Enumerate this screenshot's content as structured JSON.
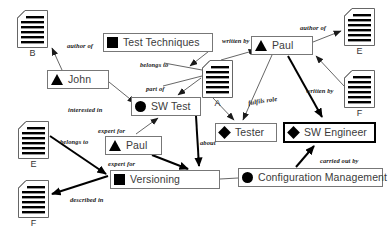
{
  "diagram": {
    "background_color": "#ffffff",
    "line_color": "#555555",
    "bold_line_color": "#000000",
    "nodes": [
      {
        "id": "test-techniques",
        "label": "Test Techniques",
        "glyph": "square",
        "x": 103,
        "y": 33,
        "w": 110,
        "highlight": false
      },
      {
        "id": "john",
        "label": "John",
        "glyph": "triangle",
        "x": 47,
        "y": 70,
        "w": 62,
        "highlight": false
      },
      {
        "id": "sw-test",
        "label": "SW Test",
        "glyph": "circle",
        "x": 131,
        "y": 97,
        "w": 70,
        "highlight": false
      },
      {
        "id": "paul-left",
        "label": "Paul",
        "glyph": "triangle",
        "x": 105,
        "y": 136,
        "w": 57,
        "highlight": false
      },
      {
        "id": "versioning",
        "label": "Versioning",
        "glyph": "square",
        "x": 110,
        "y": 170,
        "w": 110,
        "highlight": false
      },
      {
        "id": "paul-right",
        "label": "Paul",
        "glyph": "triangle",
        "x": 251,
        "y": 36,
        "w": 62,
        "highlight": false
      },
      {
        "id": "tester",
        "label": "Tester",
        "glyph": "diamond",
        "x": 215,
        "y": 123,
        "w": 62,
        "highlight": false
      },
      {
        "id": "sw-engineer",
        "label": "SW Engineer",
        "glyph": "diamond",
        "x": 283,
        "y": 122,
        "w": 93,
        "highlight": true
      },
      {
        "id": "config-mgmt",
        "label": "Configuration Management",
        "glyph": "circle",
        "x": 238,
        "y": 168,
        "w": 145,
        "highlight": false
      }
    ],
    "documents": [
      {
        "id": "doc-b",
        "label": "B",
        "x": 17,
        "y": 10
      },
      {
        "id": "doc-a",
        "label": "A",
        "x": 202,
        "y": 60
      },
      {
        "id": "doc-e-right",
        "label": "E",
        "x": 344,
        "y": 8
      },
      {
        "id": "doc-f-right",
        "label": "F",
        "x": 344,
        "y": 70
      },
      {
        "id": "doc-e-left",
        "label": "E",
        "x": 18,
        "y": 121
      },
      {
        "id": "doc-f-left",
        "label": "F",
        "x": 18,
        "y": 180
      }
    ],
    "edges": [
      {
        "id": "john-author-of-b",
        "label": "author of",
        "from": "john",
        "to": "doc-b",
        "bold": false
      },
      {
        "id": "tt-belongs-to-a",
        "label": "belongs to",
        "from": "test-techniques",
        "to": "doc-a",
        "bold": false
      },
      {
        "id": "swtest-part-of-tt",
        "label": "part of",
        "from": "doc-a",
        "to": "sw-test",
        "bold": false
      },
      {
        "id": "john-interested-in-swtest",
        "label": "interested in",
        "from": "john",
        "to": "sw-test",
        "bold": false
      },
      {
        "id": "paul-expert-for-swtest",
        "label": "expert for",
        "from": "paul-left",
        "to": "sw-test",
        "bold": false
      },
      {
        "id": "swtest-about-versioning",
        "label": "about",
        "from": "sw-test",
        "to": "versioning",
        "bold": true
      },
      {
        "id": "paul-expert-for-versioning",
        "label": "expert for",
        "from": "paul-left",
        "to": "versioning",
        "bold": true
      },
      {
        "id": "docE-belongs-to-versioning",
        "label": "belongs to",
        "from": "doc-e-left",
        "to": "versioning",
        "bold": true
      },
      {
        "id": "versioning-described-in-f",
        "label": "described in",
        "from": "versioning",
        "to": "doc-f-left",
        "bold": true
      },
      {
        "id": "a-written-by-paul",
        "label": "written by",
        "from": "doc-a",
        "to": "paul-right",
        "bold": false
      },
      {
        "id": "paul-author-of-e",
        "label": "author of",
        "from": "paul-right",
        "to": "doc-e-right",
        "bold": false
      },
      {
        "id": "f-written-by-paul",
        "label": "written by",
        "from": "doc-f-right",
        "to": "paul-right",
        "bold": false
      },
      {
        "id": "paul-fulfils-role-tester",
        "label": "fulfils role",
        "from": "paul-right",
        "to": "tester",
        "bold": false
      },
      {
        "id": "paul-fulfils-role-swe",
        "label": "",
        "from": "paul-right",
        "to": "sw-engineer",
        "bold": true
      },
      {
        "id": "cm-carried-out-by-swe",
        "label": "carried out by",
        "from": "config-mgmt",
        "to": "sw-engineer",
        "bold": true
      },
      {
        "id": "versioning-cm-link",
        "label": "",
        "from": "versioning",
        "to": "config-mgmt",
        "bold": false
      }
    ],
    "captions": [
      {
        "id": "cap-author-of-1",
        "text": "author of",
        "x": 67,
        "y": 42
      },
      {
        "id": "cap-belongs-to-1",
        "text": "belongs to",
        "x": 140,
        "y": 63
      },
      {
        "id": "cap-part-of",
        "text": "part of",
        "x": 146,
        "y": 85
      },
      {
        "id": "cap-interested-in",
        "text": "interested in",
        "x": 68,
        "y": 106
      },
      {
        "id": "cap-expert-for-1",
        "text": "expert for",
        "x": 98,
        "y": 129
      },
      {
        "id": "cap-about",
        "text": "about",
        "x": 198,
        "y": 139
      },
      {
        "id": "cap-expert-for-2",
        "text": "expert for",
        "x": 108,
        "y": 160
      },
      {
        "id": "cap-belongs-to-2",
        "text": "belongs to",
        "x": 60,
        "y": 139
      },
      {
        "id": "cap-described-in",
        "text": "described in",
        "x": 70,
        "y": 197
      },
      {
        "id": "cap-written-by-1",
        "text": "written by",
        "x": 222,
        "y": 38
      },
      {
        "id": "cap-author-of-2",
        "text": "author of",
        "x": 300,
        "y": 25
      },
      {
        "id": "cap-written-by-2",
        "text": "written by",
        "x": 307,
        "y": 88
      },
      {
        "id": "cap-fulfils-role",
        "text": "fulfils role",
        "x": 248,
        "y": 98
      },
      {
        "id": "cap-carried-out-by",
        "text": "carried out by",
        "x": 320,
        "y": 158
      }
    ]
  }
}
